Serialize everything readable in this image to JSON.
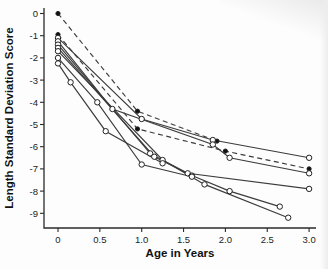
{
  "figure": {
    "ylabel": "Length Standard Deviation Score",
    "xlabel": "Age in Years"
  },
  "chart_data": {
    "type": "line",
    "title": "",
    "xlabel": "Age in Years",
    "ylabel": "Length Standard Deviation Score",
    "xlim": [
      -0.17,
      3.12
    ],
    "ylim": [
      -9.8,
      0.6
    ],
    "grid": false,
    "legend": "none",
    "x_tick_values": [
      0,
      0.5,
      1,
      1.5,
      2,
      2.5,
      3
    ],
    "x_tick_labels": [
      "0",
      "0.5",
      "1.0",
      "1.5",
      "2.0",
      "2.5",
      "3.0"
    ],
    "y_tick_values": [
      0,
      -1,
      -2,
      -3,
      -4,
      -5,
      -6,
      -7,
      -8,
      -9
    ],
    "y_tick_labels": [
      "0",
      "-1",
      "-2",
      "-3",
      "-4",
      "-5",
      "-6",
      "-7",
      "-8",
      "-9"
    ],
    "line_color": "#3c3c3c",
    "marker_open_fill": "#ffffff",
    "marker_stroke": "#222222",
    "marker_filled_fill": "#111111",
    "series": [
      {
        "name": "patient-1",
        "line": "dashed",
        "marker": "filled-circle",
        "points": [
          [
            0,
            0
          ],
          [
            0.95,
            -4.4
          ],
          [
            1.9,
            -5.75
          ]
        ]
      },
      {
        "name": "patient-2",
        "line": "dashed",
        "marker": "filled-circle",
        "points": [
          [
            0,
            -0.95
          ],
          [
            0.95,
            -5.2
          ],
          [
            2.0,
            -6.2
          ],
          [
            3.0,
            -7.0
          ]
        ]
      },
      {
        "name": "patient-3",
        "line": "solid",
        "marker": "open-circle",
        "points": [
          [
            0,
            -1.1
          ],
          [
            1.0,
            -4.75
          ],
          [
            1.85,
            -5.7
          ],
          [
            3.0,
            -6.5
          ]
        ]
      },
      {
        "name": "patient-4",
        "line": "solid",
        "marker": "open-circle",
        "points": [
          [
            0,
            -1.25
          ],
          [
            0.65,
            -4.3
          ],
          [
            1.85,
            -5.9
          ],
          [
            2.05,
            -6.5
          ],
          [
            3.0,
            -7.2
          ]
        ]
      },
      {
        "name": "patient-5",
        "line": "solid",
        "marker": "open-circle",
        "points": [
          [
            0,
            -1.4
          ],
          [
            1.1,
            -6.3
          ],
          [
            1.55,
            -7.2
          ],
          [
            3.0,
            -7.9
          ]
        ]
      },
      {
        "name": "patient-6",
        "line": "solid",
        "marker": "open-circle",
        "points": [
          [
            0,
            -1.55
          ],
          [
            1.15,
            -6.45
          ],
          [
            1.6,
            -7.3
          ],
          [
            2.05,
            -8.0
          ],
          [
            2.65,
            -8.7
          ]
        ]
      },
      {
        "name": "patient-7",
        "line": "solid",
        "marker": "open-circle",
        "points": [
          [
            0,
            -1.7
          ],
          [
            1.25,
            -6.6
          ],
          [
            1.75,
            -7.7
          ],
          [
            2.75,
            -9.2
          ]
        ]
      },
      {
        "name": "patient-8",
        "line": "solid",
        "marker": "open-circle",
        "points": [
          [
            0,
            -2.0
          ],
          [
            0.47,
            -4.0
          ],
          [
            1.0,
            -6.8
          ],
          [
            1.6,
            -7.35
          ]
        ]
      },
      {
        "name": "patient-9",
        "line": "solid",
        "marker": "open-circle",
        "points": [
          [
            0,
            -2.25
          ],
          [
            0.15,
            -3.1
          ],
          [
            0.57,
            -5.3
          ],
          [
            1.25,
            -6.75
          ]
        ]
      }
    ]
  }
}
